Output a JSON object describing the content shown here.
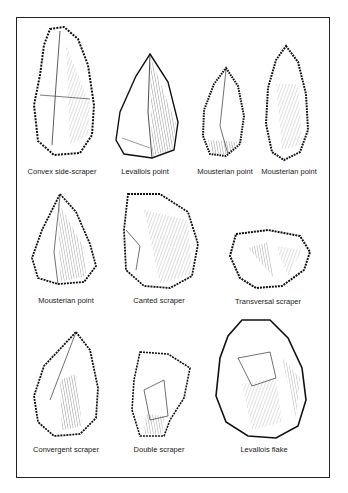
{
  "figure": {
    "tools": [
      {
        "id": "convex-side-scraper",
        "label": "Convex side-scraper"
      },
      {
        "id": "levallois-point",
        "label": "Levallois point"
      },
      {
        "id": "mousterian-point-1",
        "label": "Mousterian point"
      },
      {
        "id": "mousterian-point-2",
        "label": "Mousterian point"
      },
      {
        "id": "mousterian-point-3",
        "label": "Mousterian point"
      },
      {
        "id": "canted-scraper",
        "label": "Canted scraper"
      },
      {
        "id": "transversal-scraper",
        "label": "Transversal scraper"
      },
      {
        "id": "convergent-scraper",
        "label": "Convergent scraper"
      },
      {
        "id": "double-scraper",
        "label": "Double scraper"
      },
      {
        "id": "levallois-flake",
        "label": "Levallois flake"
      }
    ]
  }
}
